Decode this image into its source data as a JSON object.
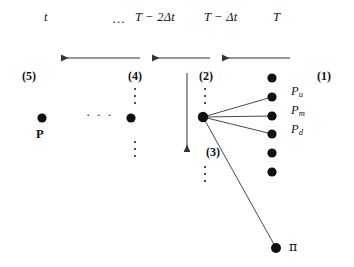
{
  "figure": {
    "background": "#ffffff",
    "ink": "#111111",
    "node_color": "#111111",
    "line_color": "#333333",
    "width": 354,
    "height": 267
  },
  "time_axis": {
    "labels": [
      {
        "id": "t",
        "text": "t",
        "x": 44,
        "y": 18
      },
      {
        "id": "ellipsis",
        "text": "…",
        "x": 112,
        "y": 18
      },
      {
        "id": "T-2dt",
        "text": "T − 2Δt",
        "x": 135,
        "y": 18
      },
      {
        "id": "T-dt",
        "text": "T − Δt",
        "x": 204,
        "y": 18
      },
      {
        "id": "T",
        "text": "T",
        "x": 273,
        "y": 18
      }
    ]
  },
  "arrows": {
    "horizontal": [
      {
        "id": "arrow-left-1",
        "x1": 140,
        "x2": 61,
        "y": 58
      },
      {
        "id": "arrow-left-2",
        "x1": 210,
        "x2": 152,
        "y": 58
      },
      {
        "id": "arrow-left-3",
        "x1": 290,
        "x2": 222,
        "y": 58
      }
    ],
    "vertical": [
      {
        "id": "arrow-down-1",
        "x": 187,
        "y1": 73,
        "y2": 152
      }
    ]
  },
  "step_tags": [
    {
      "id": "step-5",
      "text": "(5)",
      "x": 22,
      "y": 70
    },
    {
      "id": "step-4",
      "text": "(4)",
      "x": 128,
      "y": 70
    },
    {
      "id": "step-2",
      "text": "(2)",
      "x": 199,
      "y": 70
    },
    {
      "id": "step-1",
      "text": "(1)",
      "x": 317,
      "y": 70
    },
    {
      "id": "step-3",
      "text": "(3)",
      "x": 206,
      "y": 146
    }
  ],
  "nodes": [
    {
      "id": "node-P",
      "x": 42,
      "y": 118,
      "r": 4.6
    },
    {
      "id": "node-col4",
      "x": 131,
      "y": 118,
      "r": 4.6
    },
    {
      "id": "node-center",
      "x": 203,
      "y": 117,
      "r": 5.2
    },
    {
      "id": "node-T-1",
      "x": 272,
      "y": 78,
      "r": 4.6
    },
    {
      "id": "node-T-2",
      "x": 272,
      "y": 97,
      "r": 4.6
    },
    {
      "id": "node-T-3",
      "x": 272,
      "y": 116,
      "r": 4.6
    },
    {
      "id": "node-T-4",
      "x": 272,
      "y": 134,
      "r": 4.6
    },
    {
      "id": "node-T-5",
      "x": 272,
      "y": 153,
      "r": 4.6
    },
    {
      "id": "node-T-6",
      "x": 272,
      "y": 172,
      "r": 4.6
    },
    {
      "id": "node-pi",
      "x": 276,
      "y": 248,
      "r": 5.0
    }
  ],
  "edges": [
    {
      "id": "edge-center-to-Pu",
      "x1": 203,
      "y1": 117,
      "x2": 272,
      "y2": 97
    },
    {
      "id": "edge-center-to-Pm",
      "x1": 203,
      "y1": 117,
      "x2": 272,
      "y2": 116
    },
    {
      "id": "edge-center-to-Pd",
      "x1": 203,
      "y1": 117,
      "x2": 272,
      "y2": 134
    },
    {
      "id": "edge-center-to-pi",
      "x1": 203,
      "y1": 117,
      "x2": 276,
      "y2": 248
    }
  ],
  "node_labels": [
    {
      "id": "label-Pu",
      "base": "P",
      "sub": "u",
      "x": 291,
      "y": 91
    },
    {
      "id": "label-Pm",
      "base": "P",
      "sub": "m",
      "x": 291,
      "y": 110
    },
    {
      "id": "label-Pd",
      "base": "P",
      "sub": "d",
      "x": 291,
      "y": 129
    },
    {
      "id": "label-pi",
      "base": "π",
      "sub": "",
      "x": 291,
      "y": 243
    },
    {
      "id": "label-P",
      "base": "P",
      "sub": "",
      "x": 36,
      "y": 128
    }
  ],
  "ellipses": {
    "horizontal": [
      {
        "id": "hdots-mid",
        "text": "· · ·",
        "x": 86,
        "y": 112
      }
    ],
    "vertical": [
      {
        "id": "vdots-col4-top",
        "x": 134,
        "y": 88,
        "height": 16,
        "count": 3
      },
      {
        "id": "vdots-col4-bottom",
        "x": 134,
        "y": 141,
        "height": 16,
        "count": 3
      },
      {
        "id": "vdots-col2-top",
        "x": 204,
        "y": 88,
        "height": 16,
        "count": 3
      },
      {
        "id": "vdots-col2-bottom",
        "x": 204,
        "y": 166,
        "height": 16,
        "count": 3
      }
    ]
  },
  "divider": {
    "id": "vertical-divider",
    "x": 187,
    "y1": 73,
    "y2": 152
  }
}
